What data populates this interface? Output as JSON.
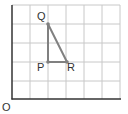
{
  "diagram": {
    "type": "coordinate-grid-triangle",
    "grid": {
      "columns": 6,
      "rows": 5,
      "line_color": "#c8c8c8",
      "axis_color": "#333333"
    },
    "origin_label": "O",
    "points": [
      {
        "name": "P",
        "label": "P",
        "x": 2,
        "y": 2
      },
      {
        "name": "Q",
        "label": "Q",
        "x": 2,
        "y": 4
      },
      {
        "name": "R",
        "label": "R",
        "x": 3,
        "y": 2
      }
    ],
    "segments": [
      [
        "P",
        "Q"
      ],
      [
        "Q",
        "R"
      ],
      [
        "P",
        "R"
      ]
    ],
    "shape_color": "#808080"
  }
}
